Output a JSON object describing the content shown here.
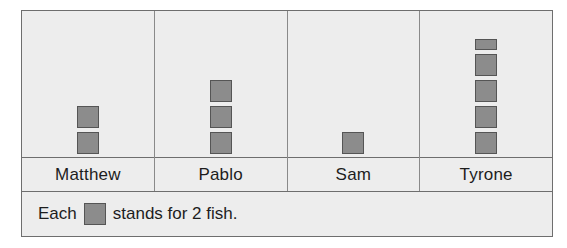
{
  "chart_data": {
    "type": "bar",
    "subtype": "pictograph",
    "title": "",
    "xlabel": "",
    "ylabel": "",
    "categories": [
      "Matthew",
      "Pablo",
      "Sam",
      "Tyrone"
    ],
    "values": [
      4,
      6,
      2,
      9
    ],
    "symbol_counts": [
      2,
      3,
      1,
      4.5
    ],
    "symbol_unit_value": 2,
    "symbol_unit_label": "fish",
    "grid": false,
    "legend_position": "bottom",
    "annotations": []
  },
  "legend": {
    "prefix": "Each",
    "suffix": "stands for 2 fish.",
    "symbol_name": "gray-square-symbol"
  },
  "colors": {
    "background": "#ededed",
    "frame_border": "#6e6e6e",
    "divider": "#8a8a8a",
    "symbol_fill": "#8c8c8c",
    "symbol_border": "#555555",
    "text": "#1d1d1d"
  },
  "columns": [
    {
      "name": "Matthew",
      "symbols": [
        {
          "type": "full"
        },
        {
          "type": "full"
        }
      ]
    },
    {
      "name": "Pablo",
      "symbols": [
        {
          "type": "full"
        },
        {
          "type": "full"
        },
        {
          "type": "full"
        }
      ]
    },
    {
      "name": "Sam",
      "symbols": [
        {
          "type": "full"
        }
      ]
    },
    {
      "name": "Tyrone",
      "symbols": [
        {
          "type": "half"
        },
        {
          "type": "full"
        },
        {
          "type": "full"
        },
        {
          "type": "full"
        },
        {
          "type": "full"
        }
      ]
    }
  ]
}
